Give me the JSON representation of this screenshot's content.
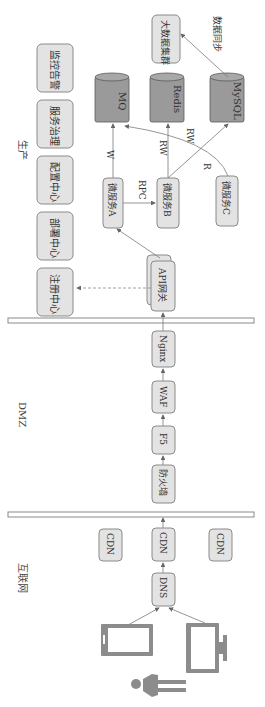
{
  "zones": {
    "production": "生产",
    "dmz": "DMZ",
    "internet": "互联网"
  },
  "infra": {
    "registry": "注册中心",
    "deploy": "部署中心",
    "config": "配置中心",
    "governance": "服务治理",
    "monitor": "监控告警"
  },
  "services": {
    "a": "微服务A",
    "b": "微服务B",
    "c": "微服务C"
  },
  "stores": {
    "mq": "MQ",
    "redis": "Redis",
    "mysql": "MySQL",
    "bigdata": "大数据集群"
  },
  "edges": {
    "w": "W",
    "rpc": "RPC",
    "rw1": "RW",
    "rw2": "RW",
    "r": "R",
    "sync": "数据同步"
  },
  "chain": {
    "gateway": "API网关",
    "nginx": "Nginx",
    "waf": "WAF",
    "f5": "F5",
    "firewall": "防火墙",
    "cdn_left": "CDN",
    "cdn_mid": "CDN",
    "cdn_right": "CDN",
    "dns": "DNS"
  }
}
